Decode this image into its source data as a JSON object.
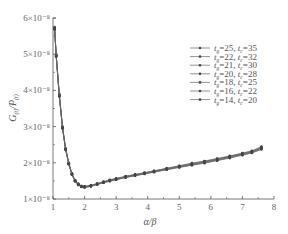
{
  "chart_data": {
    "type": "line",
    "title": "",
    "xlabel": "α/β",
    "ylabel": "G(t)/P(t)",
    "xlim": [
      1,
      8
    ],
    "ylim": [
      1e-08,
      6e-08
    ],
    "x_ticks": [
      "1",
      "2",
      "3",
      "4",
      "5",
      "6",
      "7",
      "8"
    ],
    "y_ticks": [
      "1×10⁻⁸",
      "2×10⁻⁸",
      "3×10⁻⁸",
      "4×10⁻⁸",
      "5×10⁻⁸",
      "6×10⁻⁸"
    ],
    "grid": false,
    "legend_position": "upper right",
    "x": [
      1.05,
      1.1,
      1.2,
      1.3,
      1.4,
      1.5,
      1.6,
      1.7,
      1.8,
      1.9,
      2.0,
      2.2,
      2.4,
      2.6,
      2.8,
      3.0,
      3.3,
      3.6,
      3.9,
      4.2,
      4.6,
      5.0,
      5.4,
      5.8,
      6.2,
      6.6,
      7.0,
      7.3,
      7.6
    ],
    "series": [
      {
        "name": "t_g=25, t_c=35",
        "values": [
          5.75,
          5.0,
          3.9,
          3.0,
          2.4,
          2.0,
          1.7,
          1.52,
          1.42,
          1.36,
          1.35,
          1.38,
          1.43,
          1.48,
          1.53,
          1.57,
          1.63,
          1.68,
          1.73,
          1.78,
          1.85,
          1.92,
          1.99,
          2.05,
          2.12,
          2.19,
          2.27,
          2.33,
          2.45
        ]
      },
      {
        "name": "t_g=22, t_c=32",
        "values": [
          5.73,
          4.98,
          3.88,
          2.99,
          2.39,
          1.99,
          1.7,
          1.51,
          1.41,
          1.36,
          1.34,
          1.37,
          1.42,
          1.47,
          1.52,
          1.56,
          1.62,
          1.67,
          1.72,
          1.77,
          1.84,
          1.91,
          1.98,
          2.04,
          2.11,
          2.18,
          2.26,
          2.32,
          2.43
        ]
      },
      {
        "name": "t_g=21, t_c=30",
        "values": [
          5.72,
          4.97,
          3.87,
          2.98,
          2.38,
          1.98,
          1.69,
          1.51,
          1.41,
          1.35,
          1.34,
          1.37,
          1.42,
          1.47,
          1.52,
          1.56,
          1.62,
          1.67,
          1.72,
          1.77,
          1.84,
          1.9,
          1.97,
          2.03,
          2.1,
          2.17,
          2.25,
          2.31,
          2.42
        ]
      },
      {
        "name": "t_g=20, t_c=28",
        "values": [
          5.71,
          4.96,
          3.86,
          2.98,
          2.38,
          1.98,
          1.69,
          1.5,
          1.4,
          1.35,
          1.33,
          1.36,
          1.41,
          1.46,
          1.51,
          1.55,
          1.61,
          1.66,
          1.71,
          1.76,
          1.83,
          1.9,
          1.96,
          2.02,
          2.09,
          2.16,
          2.24,
          2.3,
          2.41
        ]
      },
      {
        "name": "t_g=18, t_c=25",
        "values": [
          5.7,
          4.95,
          3.85,
          2.97,
          2.37,
          1.97,
          1.68,
          1.5,
          1.4,
          1.34,
          1.33,
          1.36,
          1.41,
          1.46,
          1.5,
          1.54,
          1.6,
          1.65,
          1.7,
          1.75,
          1.82,
          1.89,
          1.95,
          2.01,
          2.08,
          2.15,
          2.23,
          2.29,
          2.4
        ]
      },
      {
        "name": "t_g=16, t_c=22",
        "values": [
          5.69,
          4.94,
          3.84,
          2.96,
          2.37,
          1.97,
          1.68,
          1.49,
          1.39,
          1.34,
          1.32,
          1.35,
          1.4,
          1.45,
          1.5,
          1.54,
          1.6,
          1.65,
          1.7,
          1.75,
          1.81,
          1.88,
          1.94,
          2.0,
          2.07,
          2.14,
          2.22,
          2.28,
          2.38
        ]
      },
      {
        "name": "t_g=14, t_c=20",
        "values": [
          5.68,
          4.93,
          3.83,
          2.95,
          2.36,
          1.96,
          1.67,
          1.49,
          1.39,
          1.33,
          1.32,
          1.35,
          1.4,
          1.45,
          1.49,
          1.53,
          1.59,
          1.64,
          1.69,
          1.74,
          1.81,
          1.87,
          1.93,
          1.99,
          2.06,
          2.13,
          2.21,
          2.27,
          2.37
        ]
      }
    ],
    "y_scale_note": "values ×10⁻⁸"
  },
  "labels": {
    "xlabel": "α/β",
    "ylabel_main": "G",
    "ylabel_sub1": "(t)",
    "ylabel_mid": "/P",
    "ylabel_sub2": "(t)"
  },
  "colors": {
    "axis": "#555555",
    "line": "#666666",
    "marker": "#444444"
  }
}
